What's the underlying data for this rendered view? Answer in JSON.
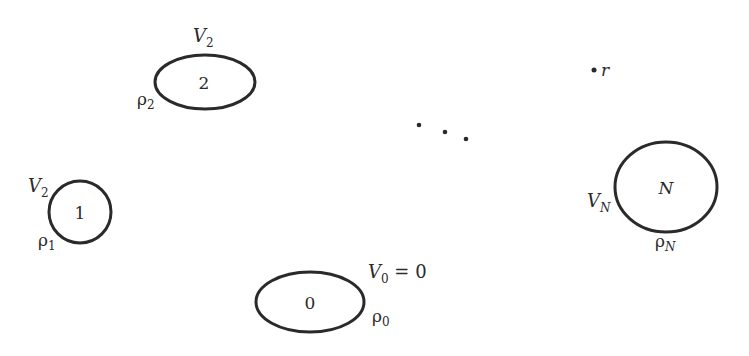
{
  "diagram": {
    "stroke_color": "#2a2a2a",
    "conductors": [
      {
        "id": "2",
        "label": "2",
        "potential": "V",
        "potential_sub": "2",
        "charge": "ρ",
        "charge_sub": "2"
      },
      {
        "id": "1",
        "label": "1",
        "potential": "V",
        "potential_sub": "2",
        "charge": "ρ",
        "charge_sub": "1"
      },
      {
        "id": "0",
        "label": "0",
        "potential": "V",
        "potential_sub": "0",
        "potential_eq": " = 0",
        "charge": "ρ",
        "charge_sub": "0"
      },
      {
        "id": "N",
        "label": "N",
        "potential": "V",
        "potential_sub": "N",
        "charge": "ρ",
        "charge_sub": "N"
      }
    ],
    "point": {
      "label": "r"
    },
    "ellipsis": "· · ·"
  }
}
